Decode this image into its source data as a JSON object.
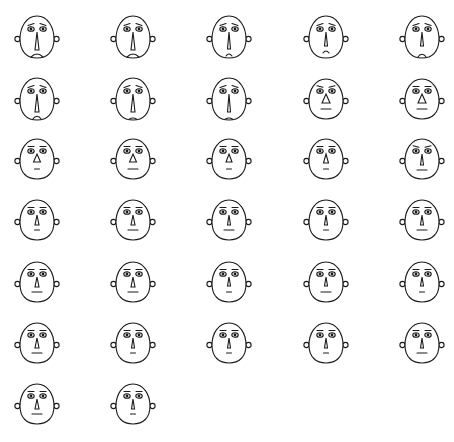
{
  "chart_data": {
    "type": "chernoff-faces",
    "title": "",
    "layout": {
      "columns": 5,
      "rows": 7,
      "count": 32,
      "legend": "none",
      "grid": false
    },
    "stroke_color": "#1a1a1a",
    "background": "#ffffff",
    "feature_encoding": {
      "brow": "eyebrow slant: -1 = sad/worried (raised inner), 0 = flat, 1 = stern",
      "nose_w": "nose triangle base width in px",
      "nose_h": "nose triangle height in px",
      "mouth": "mouth curvature: negative = frown, 0 = straight line, 'chin' = small closed frown arc at chin",
      "mouth_w": "mouth width in px",
      "head_h": "head height in px"
    },
    "faces": [
      {
        "id": 1,
        "brow": -1,
        "nose_w": 4,
        "nose_h": 18,
        "mouth": -3,
        "mouth_w": 12,
        "head_h": 42
      },
      {
        "id": 2,
        "brow": -1,
        "nose_w": 4,
        "nose_h": 18,
        "mouth": -3,
        "mouth_w": 12,
        "head_h": 42
      },
      {
        "id": 3,
        "brow": -1,
        "nose_w": 3,
        "nose_h": 17,
        "mouth": -2,
        "mouth_w": 6,
        "head_h": 42
      },
      {
        "id": 4,
        "brow": -1,
        "nose_w": 3,
        "nose_h": 14,
        "mouth": -2,
        "mouth_w": 6,
        "head_h": 42
      },
      {
        "id": 5,
        "brow": -1,
        "nose_w": 3,
        "nose_h": 14,
        "mouth": "chin",
        "mouth_w": 9,
        "head_h": 42
      },
      {
        "id": 6,
        "brow": -1,
        "nose_w": 4,
        "nose_h": 18,
        "mouth": "chin",
        "mouth_w": 9,
        "head_h": 42
      },
      {
        "id": 7,
        "brow": -1,
        "nose_w": 4,
        "nose_h": 18,
        "mouth": -1,
        "mouth_w": 7,
        "head_h": 42
      },
      {
        "id": 8,
        "brow": -1,
        "nose_w": 3,
        "nose_h": 18,
        "mouth": -1,
        "mouth_w": 7,
        "head_h": 42
      },
      {
        "id": 9,
        "brow": 1,
        "nose_w": 8,
        "nose_h": 9,
        "mouth": 0,
        "mouth_w": 10,
        "head_h": 40
      },
      {
        "id": 10,
        "brow": 0,
        "nose_w": 8,
        "nose_h": 9,
        "mouth": 0,
        "mouth_w": 10,
        "head_h": 40
      },
      {
        "id": 11,
        "brow": 0,
        "nose_w": 7,
        "nose_h": 8,
        "mouth": 0,
        "mouth_w": 5,
        "head_h": 40
      },
      {
        "id": 12,
        "brow": 0,
        "nose_w": 7,
        "nose_h": 8,
        "mouth": 0,
        "mouth_w": 10,
        "head_h": 40
      },
      {
        "id": 13,
        "brow": 0,
        "nose_w": 6,
        "nose_h": 8,
        "mouth": 0,
        "mouth_w": 5,
        "head_h": 40
      },
      {
        "id": 14,
        "brow": 0,
        "nose_w": 5,
        "nose_h": 9,
        "mouth": 0,
        "mouth_w": 5,
        "head_h": 40
      },
      {
        "id": 15,
        "brow": 1,
        "nose_w": 3,
        "nose_h": 11,
        "mouth": 0,
        "mouth_w": 10,
        "head_h": 40
      },
      {
        "id": 16,
        "brow": 0,
        "nose_w": 4,
        "nose_h": 10,
        "mouth": 0,
        "mouth_w": 5,
        "head_h": 40
      },
      {
        "id": 17,
        "brow": 0,
        "nose_w": 4,
        "nose_h": 10,
        "mouth": 0,
        "mouth_w": 10,
        "head_h": 40
      },
      {
        "id": 18,
        "brow": 0,
        "nose_w": 3,
        "nose_h": 10,
        "mouth": 0,
        "mouth_w": 10,
        "head_h": 40
      },
      {
        "id": 19,
        "brow": 0,
        "nose_w": 3,
        "nose_h": 10,
        "mouth": 0,
        "mouth_w": 5,
        "head_h": 40
      },
      {
        "id": 20,
        "brow": 0,
        "nose_w": 3,
        "nose_h": 10,
        "mouth": 0,
        "mouth_w": 10,
        "head_h": 40
      },
      {
        "id": 21,
        "brow": 0,
        "nose_w": 4,
        "nose_h": 10,
        "mouth": 0,
        "mouth_w": 10,
        "head_h": 40
      },
      {
        "id": 22,
        "brow": 0,
        "nose_w": 4,
        "nose_h": 10,
        "mouth": 0,
        "mouth_w": 10,
        "head_h": 40
      },
      {
        "id": 23,
        "brow": 0,
        "nose_w": 3,
        "nose_h": 9,
        "mouth": 0,
        "mouth_w": 5,
        "head_h": 40
      },
      {
        "id": 24,
        "brow": 0,
        "nose_w": 3,
        "nose_h": 9,
        "mouth": 0,
        "mouth_w": 10,
        "head_h": 40
      },
      {
        "id": 25,
        "brow": 0,
        "nose_w": 3,
        "nose_h": 9,
        "mouth": 0,
        "mouth_w": 5,
        "head_h": 40
      },
      {
        "id": 26,
        "brow": 0,
        "nose_w": 4,
        "nose_h": 10,
        "mouth": 0,
        "mouth_w": 10,
        "head_h": 40
      },
      {
        "id": 27,
        "brow": 0,
        "nose_w": 3,
        "nose_h": 10,
        "mouth": 0,
        "mouth_w": 5,
        "head_h": 40
      },
      {
        "id": 28,
        "brow": 0,
        "nose_w": 3,
        "nose_h": 10,
        "mouth": 0,
        "mouth_w": 5,
        "head_h": 40
      },
      {
        "id": 29,
        "brow": 0,
        "nose_w": 3,
        "nose_h": 10,
        "mouth": 0,
        "mouth_w": 5,
        "head_h": 40
      },
      {
        "id": 30,
        "brow": 0,
        "nose_w": 3,
        "nose_h": 10,
        "mouth": 0,
        "mouth_w": 10,
        "head_h": 40
      },
      {
        "id": 31,
        "brow": 0,
        "nose_w": 4,
        "nose_h": 10,
        "mouth": 0,
        "mouth_w": 10,
        "head_h": 40
      },
      {
        "id": 32,
        "brow": 0,
        "nose_w": 3,
        "nose_h": 10,
        "mouth": 0,
        "mouth_w": 5,
        "head_h": 40
      }
    ],
    "positions": {
      "column_centers_x": [
        37,
        133,
        229,
        326,
        422
      ],
      "row_centers_y": [
        37,
        99,
        159,
        220,
        282,
        343,
        404
      ]
    }
  }
}
